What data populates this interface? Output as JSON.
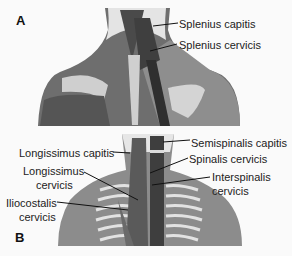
{
  "panel_a": {
    "letter": "A",
    "labels": [
      {
        "text": "Splenius capitis"
      },
      {
        "text": "Splenius cervicis"
      }
    ]
  },
  "panel_b": {
    "letter": "B",
    "labels": [
      {
        "text": "Semispinalis capitis"
      },
      {
        "text": "Longissimus capitis"
      },
      {
        "text": "Spinalis cervicis"
      },
      {
        "text": "Longissimus",
        "text2": "cervicis"
      },
      {
        "text": "Interspinalis",
        "text2": "cervicis"
      },
      {
        "text": "Iliocostalis",
        "text2": "cervicis"
      }
    ]
  },
  "colors": {
    "skin": "#8e8e8e",
    "muscle": "#5a5a5a",
    "muscle_dark": "#3a3a3a",
    "bone": "#d8d8d8",
    "neck_bg": "#e6e6e6"
  }
}
